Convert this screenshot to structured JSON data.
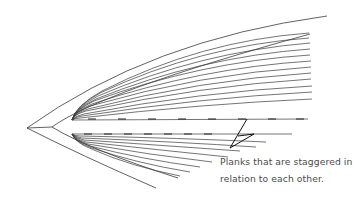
{
  "figure": {
    "type": "boat hull planking diagram (plan view)",
    "stroke_color": "#3a3a3a",
    "pointer_color": "#111111",
    "background": "#ffffff"
  },
  "annotation": {
    "line1": "Planks that are staggered in",
    "line2": "relation to each other."
  },
  "geometry": {
    "apex": [
      27,
      128
    ],
    "junction": [
      52,
      127
    ],
    "outer_top_end": [
      327,
      16
    ],
    "outer_bottom_end": [
      156,
      188
    ],
    "upper_plank_count": 13,
    "lower_plank_count": 9,
    "pointer_tip": [
      230,
      148
    ]
  }
}
